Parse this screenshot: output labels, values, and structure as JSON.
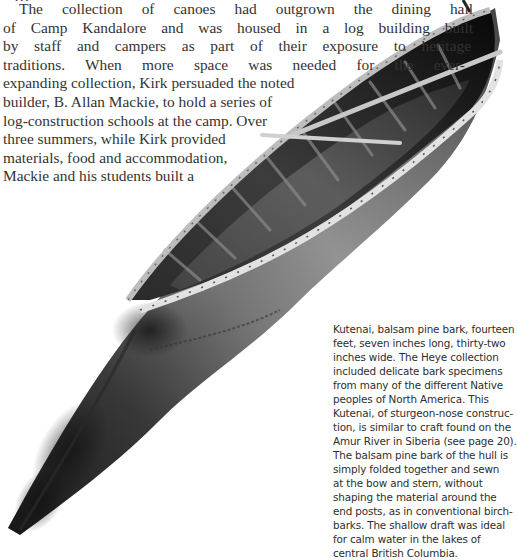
{
  "document": {
    "type": "book-page",
    "cut_off_top_line": "…",
    "body_paragraph": {
      "lines": [
        "The collection of canoes had outgrown the dining hall",
        "of Camp Kandalore and was housed in a log building built",
        "by staff and campers as part of their exposure to heritage",
        "traditions. When more space was needed for the ever-",
        "expanding collection, Kirk persuaded the noted",
        "builder, B. Allan Mackie, to hold a series of",
        "log-construction schools at the camp. Over",
        "three summers, while Kirk provided",
        "materials, food and accommodation,",
        "Mackie and his students built a"
      ]
    },
    "figure": {
      "subject": "Kutenai sturgeon-nose bark canoe photograph",
      "caption_lines": [
        "Kutenai, balsam pine bark, fourteen",
        "feet, seven inches long, thirty-two",
        "inches wide. The Heye collection",
        "included delicate bark specimens",
        "from many of the different Native",
        "peoples of North America. This",
        "Kutenai, of sturgeon-nose construc-",
        "tion, is similar to craft found on the",
        "Amur River in Siberia (see page 20).",
        "The balsam pine bark of the hull is",
        "simply folded together and sewn",
        "at the bow and stern, without",
        "shaping the material around the",
        "end posts, as in conventional birch-",
        "barks. The shallow draft was ideal",
        "for calm water in the lakes of",
        "central British Columbia."
      ]
    },
    "colors": {
      "background": "#ffffff",
      "body_text": "#333333",
      "caption_text": "#2e2e2e",
      "canoe_dark": "#151515",
      "canoe_mid": "#6a6a6a",
      "canoe_light": "#b8b8b8",
      "gunwale": "#d8d8d8"
    }
  }
}
